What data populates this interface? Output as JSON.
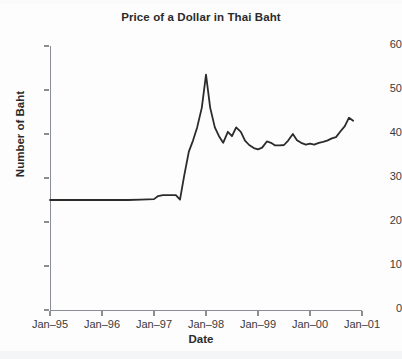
{
  "chart_data": {
    "type": "line",
    "title": "Price of a Dollar in Thai Baht",
    "xlabel": "Date",
    "ylabel": "Number of Baht",
    "ylim": [
      0,
      60
    ],
    "yticks": [
      0,
      10,
      20,
      30,
      40,
      50,
      60
    ],
    "ytick_labels": [
      "0",
      "10",
      "20",
      "30",
      "40",
      "50",
      "60"
    ],
    "xlim": [
      "Jan-95",
      "Jan-01"
    ],
    "xticks": [
      "Jan-95",
      "Jan-96",
      "Jan-97",
      "Jan-98",
      "Jan-99",
      "Jan-00",
      "Jan-01"
    ],
    "xtick_labels": [
      "Jan–95",
      "Jan–96",
      "Jan–97",
      "Jan–98",
      "Jan–99",
      "Jan–00",
      "Jan–01"
    ],
    "grid": false,
    "legend": null,
    "line_color": "#2b2b2b",
    "line_width": 1.8,
    "x": [
      1995.0,
      1995.25,
      1995.5,
      1995.75,
      1996.0,
      1996.25,
      1996.5,
      1996.75,
      1997.0,
      1997.08,
      1997.17,
      1997.25,
      1997.33,
      1997.42,
      1997.5,
      1997.58,
      1997.67,
      1997.75,
      1997.83,
      1997.92,
      1998.0,
      1998.08,
      1998.17,
      1998.25,
      1998.33,
      1998.42,
      1998.5,
      1998.58,
      1998.67,
      1998.75,
      1998.83,
      1998.92,
      1999.0,
      1999.08,
      1999.17,
      1999.25,
      1999.33,
      1999.42,
      1999.5,
      1999.58,
      1999.67,
      1999.75,
      1999.83,
      1999.92,
      2000.0,
      2000.08,
      2000.17,
      2000.25,
      2000.33,
      2000.42,
      2000.5,
      2000.58,
      2000.67,
      2000.75,
      2000.83
    ],
    "values": [
      25.0,
      25.0,
      25.0,
      25.0,
      25.0,
      25.0,
      25.0,
      25.1,
      25.2,
      25.9,
      26.1,
      26.1,
      26.1,
      26.1,
      25.1,
      30.5,
      36.0,
      38.5,
      41.5,
      46.0,
      53.5,
      46.0,
      41.5,
      39.5,
      38.0,
      40.5,
      39.5,
      41.5,
      40.5,
      38.5,
      37.5,
      36.8,
      36.5,
      36.9,
      38.3,
      38.0,
      37.4,
      37.4,
      37.5,
      38.5,
      40.0,
      38.6,
      38.0,
      37.6,
      37.8,
      37.6,
      38.0,
      38.2,
      38.5,
      39.0,
      39.3,
      40.5,
      41.8,
      43.7,
      43.0
    ],
    "annotations": [
      {
        "label": "flat peg near 25 baht",
        "x": "Jan-95 to mid-1997",
        "value": 25.0
      },
      {
        "label": "peak",
        "x": "Jan-98",
        "value": 53.5
      },
      {
        "label": "series end",
        "x": "late 2000",
        "value": 43.0
      }
    ]
  }
}
